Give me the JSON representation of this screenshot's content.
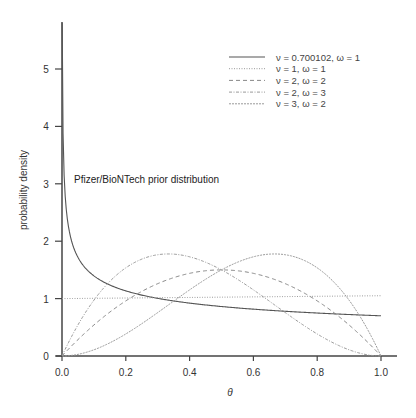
{
  "chart_data": {
    "type": "line",
    "title": "",
    "xlabel": "θ",
    "ylabel": "probability density",
    "xlim": [
      0,
      1
    ],
    "ylim": [
      0,
      5.8
    ],
    "xticks": [
      "0.0",
      "0.2",
      "0.4",
      "0.6",
      "0.8",
      "1.0"
    ],
    "xtick_values": [
      0,
      0.2,
      0.4,
      0.6,
      0.8,
      1.0
    ],
    "yticks": [
      "0",
      "1",
      "2",
      "3",
      "4",
      "5"
    ],
    "ytick_values": [
      0,
      1,
      2,
      3,
      4,
      5
    ],
    "grid": false,
    "legend_position": "upper right",
    "annotation": "Pfizer/BioNTech prior distribution",
    "x": [
      0.0,
      0.05,
      0.1,
      0.15,
      0.2,
      0.25,
      0.3,
      0.35,
      0.4,
      0.45,
      0.5,
      0.55,
      0.6,
      0.65,
      0.7,
      0.75,
      0.8,
      0.85,
      0.9,
      0.95,
      1.0
    ],
    "series": [
      {
        "name": "ν = 0.700102, ω = 1",
        "style": "solid",
        "color": "#555555",
        "values": [
          5.8,
          1.72,
          1.4,
          1.24,
          1.14,
          1.06,
          1.0,
          0.96,
          0.92,
          0.89,
          0.86,
          0.84,
          0.82,
          0.8,
          0.78,
          0.77,
          0.75,
          0.74,
          0.73,
          0.72,
          0.7
        ]
      },
      {
        "name": "ν = 1, ω = 1",
        "style": "dotted",
        "color": "#999999",
        "values": [
          1.0,
          1.0,
          1.0,
          1.0,
          1.0,
          1.0,
          1.0,
          1.0,
          1.0,
          1.0,
          1.0,
          1.0,
          1.0,
          1.0,
          1.0,
          1.0,
          1.0,
          1.0,
          1.0,
          1.0,
          1.0
        ]
      },
      {
        "name": "ν = 2, ω = 2",
        "style": "dashed",
        "color": "#888888",
        "values": [
          0.0,
          0.285,
          0.54,
          0.765,
          0.96,
          1.125,
          1.26,
          1.365,
          1.44,
          1.485,
          1.5,
          1.485,
          1.44,
          1.365,
          1.26,
          1.125,
          0.96,
          0.765,
          0.54,
          0.285,
          0.0
        ]
      },
      {
        "name": "ν = 2, ω = 3",
        "style": "dashdot",
        "color": "#999999",
        "values": [
          0.0,
          0.542,
          0.972,
          1.301,
          1.536,
          1.688,
          1.764,
          1.774,
          1.728,
          1.634,
          1.5,
          1.337,
          1.152,
          0.956,
          0.756,
          0.563,
          0.384,
          0.23,
          0.108,
          0.029,
          0.0
        ]
      },
      {
        "name": "ν = 3, ω = 2",
        "style": "longdash",
        "color": "#999999",
        "values": [
          0.0,
          0.029,
          0.108,
          0.23,
          0.384,
          0.563,
          0.756,
          0.956,
          1.152,
          1.337,
          1.5,
          1.634,
          1.728,
          1.774,
          1.764,
          1.688,
          1.536,
          1.301,
          0.972,
          0.542,
          0.0
        ]
      }
    ]
  }
}
